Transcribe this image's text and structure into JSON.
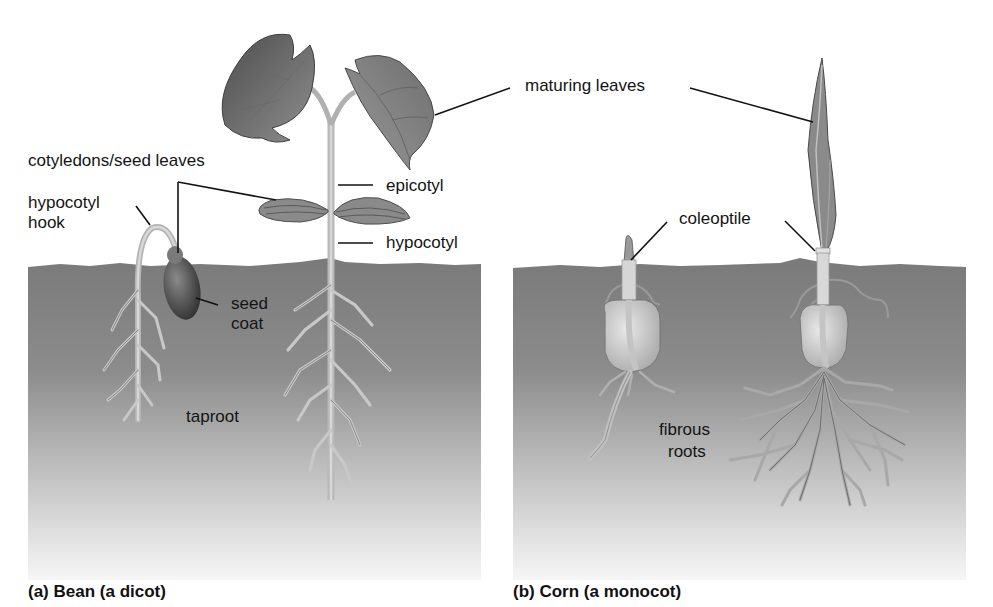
{
  "figure": {
    "panels": [
      {
        "id": "a",
        "caption": "(a) Bean (a dicot)",
        "labels": {
          "cotyledons": "cotyledons/seed leaves",
          "hypocotyl_hook_line1": "hypocotyl",
          "hypocotyl_hook_line2": "hook",
          "epicotyl": "epicotyl",
          "hypocotyl": "hypocotyl",
          "seed_coat_line1": "seed",
          "seed_coat_line2": "coat",
          "taproot": "taproot"
        }
      },
      {
        "id": "b",
        "caption": "(b) Corn (a monocot)",
        "labels": {
          "coleoptile": "coleoptile",
          "fibrous_roots_line1": "fibrous",
          "fibrous_roots_line2": "roots"
        }
      }
    ],
    "shared_labels": {
      "maturing_leaves": "maturing leaves"
    },
    "colors": {
      "soil_top": "#7a7a7a",
      "soil_bottom": "#f4f4f4",
      "leaf_dark": "#5a5a5a",
      "leaf_mid": "#8a8a8a",
      "stem": "#c8c8c8",
      "seed_coat": "#4a4a4a",
      "leader_line": "#111111"
    }
  }
}
